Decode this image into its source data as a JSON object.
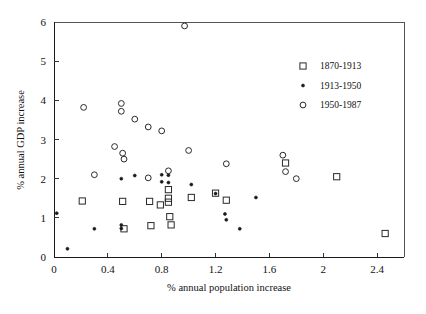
{
  "chart_data": {
    "type": "scatter",
    "title": "",
    "xlabel": "% annual population increase",
    "ylabel": "% annual GDP increase",
    "xlim": [
      0,
      2.6
    ],
    "ylim": [
      0,
      6
    ],
    "xticks": [
      "0",
      "0.4",
      "0.8",
      "1.2",
      "1.6",
      "2",
      "2.4"
    ],
    "xtick_values": [
      0,
      0.4,
      0.8,
      1.2,
      1.6,
      2,
      2.4
    ],
    "yticks": [
      "0",
      "1",
      "2",
      "3",
      "4",
      "5",
      "6"
    ],
    "ytick_values": [
      0,
      1,
      2,
      3,
      4,
      5,
      6
    ],
    "grid": false,
    "legend_position": "upper right",
    "series": [
      {
        "name": "1870-1913",
        "marker": "open-square",
        "points": [
          [
            0.21,
            1.43
          ],
          [
            0.51,
            1.42
          ],
          [
            0.52,
            0.72
          ],
          [
            0.71,
            1.42
          ],
          [
            0.72,
            0.8
          ],
          [
            0.79,
            1.33
          ],
          [
            0.85,
            1.72
          ],
          [
            0.85,
            1.5
          ],
          [
            0.85,
            1.4
          ],
          [
            0.86,
            1.03
          ],
          [
            0.87,
            0.82
          ],
          [
            1.02,
            1.52
          ],
          [
            1.2,
            1.63
          ],
          [
            1.28,
            1.45
          ],
          [
            1.72,
            2.4
          ],
          [
            2.1,
            2.05
          ],
          [
            2.46,
            0.6
          ]
        ]
      },
      {
        "name": "1913-1950",
        "marker": "filled-dot",
        "points": [
          [
            0.02,
            1.12
          ],
          [
            0.1,
            0.21
          ],
          [
            0.3,
            0.72
          ],
          [
            0.5,
            2.0
          ],
          [
            0.5,
            0.82
          ],
          [
            0.5,
            0.73
          ],
          [
            0.6,
            2.08
          ],
          [
            0.8,
            2.1
          ],
          [
            0.8,
            1.92
          ],
          [
            0.85,
            2.09
          ],
          [
            0.85,
            1.9
          ],
          [
            1.02,
            1.85
          ],
          [
            1.2,
            1.62
          ],
          [
            1.27,
            1.1
          ],
          [
            1.28,
            0.95
          ],
          [
            1.38,
            0.72
          ],
          [
            1.5,
            1.52
          ]
        ]
      },
      {
        "name": "1950-1987",
        "marker": "open-circle",
        "points": [
          [
            0.22,
            3.82
          ],
          [
            0.3,
            2.1
          ],
          [
            0.45,
            2.82
          ],
          [
            0.5,
            3.92
          ],
          [
            0.5,
            3.72
          ],
          [
            0.51,
            2.65
          ],
          [
            0.52,
            2.5
          ],
          [
            0.6,
            3.52
          ],
          [
            0.7,
            3.32
          ],
          [
            0.7,
            2.02
          ],
          [
            0.8,
            3.22
          ],
          [
            0.85,
            2.2
          ],
          [
            0.97,
            5.9
          ],
          [
            1.0,
            2.72
          ],
          [
            1.28,
            2.38
          ],
          [
            1.7,
            2.6
          ],
          [
            1.72,
            2.18
          ],
          [
            1.8,
            2.0
          ]
        ]
      }
    ]
  },
  "legend": {
    "entries": [
      {
        "label": "1870-1913",
        "marker": "open-square"
      },
      {
        "label": "1913-1950",
        "marker": "filled-dot"
      },
      {
        "label": "1950-1987",
        "marker": "open-circle"
      }
    ]
  },
  "colors": {
    "axis": "#1a1a1a",
    "frame": "#555555",
    "marker": "#2a2a2a",
    "background": "#ffffff"
  }
}
